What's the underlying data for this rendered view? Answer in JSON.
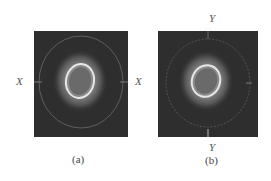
{
  "figure": {
    "panels": [
      {
        "id": "a",
        "caption": "(a)",
        "axis_labels": {
          "left": "X",
          "right": "X"
        },
        "description": "Dark square field with concentric elliptical intensity pattern: outer faint ring, bright halo, inner bright elliptical ring around dark core"
      },
      {
        "id": "b",
        "caption": "(b)",
        "axis_labels": {
          "left": "X",
          "top": "Y",
          "bottom": "Y"
        },
        "description": "Dark square field with concentric elliptical intensity pattern, slightly rotated; faint outer ring with tick marks"
      }
    ],
    "colors": {
      "background": "#ffffff",
      "field": "#2e2e2e",
      "halo": "#8a8a8a",
      "ring": "#e6e6e6",
      "core": "#6a6a6a"
    }
  }
}
